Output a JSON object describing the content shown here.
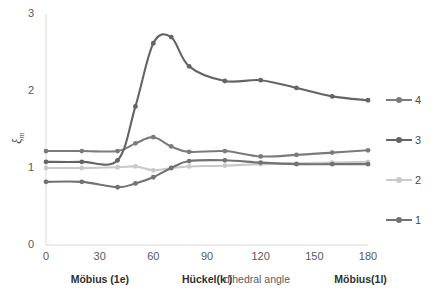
{
  "chart_data": {
    "type": "line",
    "title": "",
    "subtitle": "",
    "xlabel": "dihedral angle",
    "ylabel": "ξm",
    "ylabel_symbol": "ξ",
    "ylabel_subscript": "m",
    "xlim": [
      0,
      180
    ],
    "ylim": [
      0,
      3
    ],
    "xticks": [
      0,
      30,
      60,
      90,
      120,
      150,
      180
    ],
    "xtick_labels": [
      "0",
      "30",
      "60",
      "90",
      "120",
      "150",
      "180"
    ],
    "yticks": [
      0,
      1,
      2,
      3
    ],
    "ytick_labels": [
      "0",
      "1",
      "2",
      "3"
    ],
    "grid": false,
    "legend_position": "right",
    "x": [
      0,
      20,
      40,
      50,
      60,
      70,
      80,
      100,
      120,
      140,
      160,
      180
    ],
    "series": [
      {
        "name": "1",
        "label": "1",
        "color": "#767171",
        "values": [
          0.82,
          0.82,
          0.75,
          0.8,
          0.88,
          1.0,
          1.09,
          1.1,
          1.07,
          1.05,
          1.05,
          1.05
        ]
      },
      {
        "name": "2",
        "label": "2",
        "color": "#c9c9c9",
        "values": [
          1.0,
          1.0,
          1.01,
          1.02,
          0.97,
          1.0,
          1.02,
          1.03,
          1.05,
          1.06,
          1.07,
          1.08
        ]
      },
      {
        "name": "3",
        "label": "3",
        "color": "#646464",
        "values": [
          1.08,
          1.08,
          1.1,
          1.8,
          2.62,
          2.7,
          2.32,
          2.13,
          2.14,
          2.04,
          1.93,
          1.88
        ]
      },
      {
        "name": "4",
        "label": "4",
        "color": "#7b7b7b",
        "values": [
          1.22,
          1.22,
          1.22,
          1.32,
          1.4,
          1.28,
          1.21,
          1.22,
          1.15,
          1.17,
          1.2,
          1.23
        ]
      }
    ],
    "legend_entries": [
      {
        "label": "4",
        "color": "#7b7b7b"
      },
      {
        "label": "3",
        "color": "#646464"
      },
      {
        "label": "2",
        "color": "#c9c9c9"
      },
      {
        "label": "1",
        "color": "#767171"
      }
    ],
    "annotations": [
      {
        "text": "Möbius (1e)",
        "x_value": 30,
        "style": "bold"
      },
      {
        "text": "Hückel(k )",
        "x_value": 90,
        "style": "bold"
      },
      {
        "text": "dihedral angle",
        "x_value": 118,
        "style": "plain"
      },
      {
        "text": "Möbius(1l)",
        "x_value": 176,
        "style": "bold"
      }
    ],
    "axis_color": "#d9d9d9",
    "tick_text_color": "#595959"
  }
}
